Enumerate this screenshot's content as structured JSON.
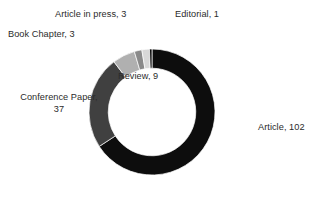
{
  "chart_data": {
    "type": "pie",
    "variant": "donut",
    "title": "",
    "subtitle": "",
    "xlabel": "",
    "ylabel": "",
    "total": 155,
    "grid": false,
    "legend_position": "none",
    "label_format": "category, value",
    "start_angle_deg": 0,
    "direction": "clockwise",
    "inner_radius_ratio": 0.695,
    "categories": [
      "Article",
      "Conference Paper",
      "Review",
      "Book Chapter",
      "Article in press",
      "Editorial"
    ],
    "values": [
      102,
      37,
      9,
      3,
      3,
      1
    ],
    "slices": [
      {
        "label": "Article",
        "value": 102,
        "text": "Article, 102",
        "color": "#0d0d0d",
        "percent": 65.8,
        "label_placement": "outside-right"
      },
      {
        "label": "Conference Paper",
        "value": 37,
        "text": "Conference\nPaper, 37",
        "line1": "Conference",
        "line2": "Paper, 37",
        "color": "#404040",
        "percent": 23.9,
        "label_placement": "outside-left"
      },
      {
        "label": "Review",
        "value": 9,
        "text": "Review, 9",
        "color": "#b0b0b0",
        "percent": 5.8,
        "label_placement": "center-hole"
      },
      {
        "label": "Book Chapter",
        "value": 3,
        "text": "Book Chapter, 3",
        "color": "#8a8a8a",
        "percent": 1.9,
        "label_placement": "outside-upper-left"
      },
      {
        "label": "Article in press",
        "value": 3,
        "text": "Article in press, 3",
        "color": "#d8d8d8",
        "percent": 1.9,
        "label_placement": "outside-top"
      },
      {
        "label": "Editorial",
        "value": 1,
        "text": "Editorial, 1",
        "color": "#0d0d0d",
        "percent": 0.6,
        "label_placement": "outside-top-right"
      }
    ],
    "colors": {
      "article": "#0d0d0d",
      "conference_paper": "#404040",
      "review": "#b0b0b0",
      "book_chapter": "#8a8a8a",
      "article_in_press": "#d8d8d8",
      "editorial": "#0d0d0d",
      "background": "#ffffff",
      "label_text": "#2b2b2b"
    }
  },
  "labels": {
    "article": "Article, 102",
    "conference_paper_line1": "Conference",
    "conference_paper_line2": "Paper, 37",
    "review": "Review, 9",
    "book_chapter": "Book Chapter, 3",
    "article_in_press": "Article in press, 3",
    "editorial": "Editorial, 1"
  }
}
